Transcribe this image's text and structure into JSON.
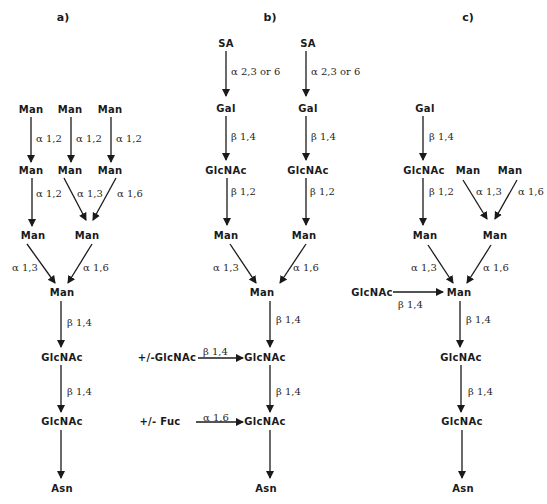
{
  "panels": [
    {
      "label": "a)",
      "label_pos": [
        63,
        21
      ],
      "nodes": [
        {
          "id": "a_m1",
          "text": "Man",
          "x": 31,
          "y": 113
        },
        {
          "id": "a_m2",
          "text": "Man",
          "x": 70,
          "y": 113
        },
        {
          "id": "a_m3",
          "text": "Man",
          "x": 110,
          "y": 113
        },
        {
          "id": "a_m4",
          "text": "Man",
          "x": 31,
          "y": 174
        },
        {
          "id": "a_m5",
          "text": "Man",
          "x": 70,
          "y": 174
        },
        {
          "id": "a_m6",
          "text": "Man",
          "x": 110,
          "y": 174
        },
        {
          "id": "a_m7",
          "text": "Man",
          "x": 33,
          "y": 239
        },
        {
          "id": "a_m8",
          "text": "Man",
          "x": 87,
          "y": 239
        },
        {
          "id": "a_m9",
          "text": "Man",
          "x": 62,
          "y": 296
        },
        {
          "id": "a_g1",
          "text": "GlcNAc",
          "x": 62,
          "y": 361
        },
        {
          "id": "a_g2",
          "text": "GlcNAc",
          "x": 62,
          "y": 425
        },
        {
          "id": "a_asn",
          "text": "Asn",
          "x": 62,
          "y": 492
        }
      ],
      "edges": [
        {
          "x1": 31,
          "y1": 117,
          "x2": 31,
          "y2": 162,
          "label": "α 1,2",
          "lx": 36,
          "ly": 139
        },
        {
          "x1": 71,
          "y1": 117,
          "x2": 71,
          "y2": 162,
          "label": "α 1,2",
          "lx": 76,
          "ly": 139
        },
        {
          "x1": 111,
          "y1": 117,
          "x2": 111,
          "y2": 162,
          "label": "α 1,2",
          "lx": 116,
          "ly": 139
        },
        {
          "x1": 32,
          "y1": 178,
          "x2": 32,
          "y2": 226,
          "label": "α 1,2",
          "lx": 36,
          "ly": 194
        },
        {
          "x1": 64,
          "y1": 178,
          "x2": 86,
          "y2": 220,
          "label": "α 1,3",
          "lx": 77,
          "ly": 194
        },
        {
          "x1": 116,
          "y1": 178,
          "x2": 93,
          "y2": 220,
          "label": "α 1,6",
          "lx": 117,
          "ly": 194
        },
        {
          "x1": 27,
          "y1": 244,
          "x2": 55,
          "y2": 283,
          "label": "α 1,3",
          "lx": 12,
          "ly": 268
        },
        {
          "x1": 92,
          "y1": 244,
          "x2": 68,
          "y2": 283,
          "label": "α 1,6",
          "lx": 83,
          "ly": 268
        },
        {
          "x1": 61,
          "y1": 301,
          "x2": 61,
          "y2": 347,
          "label": "β 1,4",
          "lx": 67,
          "ly": 323
        },
        {
          "x1": 61,
          "y1": 365,
          "x2": 61,
          "y2": 412,
          "label": "β 1,4",
          "lx": 67,
          "ly": 392
        },
        {
          "x1": 61,
          "y1": 430,
          "x2": 61,
          "y2": 478,
          "label": "",
          "lx": 0,
          "ly": 0
        }
      ]
    },
    {
      "label": "b)",
      "label_pos": [
        270,
        21
      ],
      "nodes": [
        {
          "id": "b_sa1",
          "text": "SA",
          "x": 226,
          "y": 47
        },
        {
          "id": "b_sa2",
          "text": "SA",
          "x": 308,
          "y": 47
        },
        {
          "id": "b_gal1",
          "text": "Gal",
          "x": 226,
          "y": 112
        },
        {
          "id": "b_gal2",
          "text": "Gal",
          "x": 308,
          "y": 112
        },
        {
          "id": "b_g1",
          "text": "GlcNAc",
          "x": 226,
          "y": 174
        },
        {
          "id": "b_g2",
          "text": "GlcNAc",
          "x": 308,
          "y": 174
        },
        {
          "id": "b_m1",
          "text": "Man",
          "x": 226,
          "y": 239
        },
        {
          "id": "b_m2",
          "text": "Man",
          "x": 304,
          "y": 239
        },
        {
          "id": "b_m3",
          "text": "Man",
          "x": 262,
          "y": 296
        },
        {
          "id": "b_g3",
          "text": "GlcNAc",
          "x": 265,
          "y": 361
        },
        {
          "id": "b_g4",
          "text": "GlcNAc",
          "x": 265,
          "y": 425
        },
        {
          "id": "b_asn",
          "text": "Asn",
          "x": 266,
          "y": 492
        },
        {
          "id": "b_opt1",
          "text": "+/-GlcNAc",
          "x": 167,
          "y": 361
        },
        {
          "id": "b_opt2",
          "text": "+/-  Fuc",
          "x": 160,
          "y": 425
        }
      ],
      "edges": [
        {
          "x1": 226,
          "y1": 51,
          "x2": 226,
          "y2": 96,
          "label": "α 2,3 or 6",
          "lx": 231,
          "ly": 72
        },
        {
          "x1": 306,
          "y1": 51,
          "x2": 306,
          "y2": 96,
          "label": "α 2,3 or 6",
          "lx": 311,
          "ly": 72
        },
        {
          "x1": 226,
          "y1": 116,
          "x2": 226,
          "y2": 160,
          "label": "β 1,4",
          "lx": 231,
          "ly": 137
        },
        {
          "x1": 306,
          "y1": 116,
          "x2": 306,
          "y2": 160,
          "label": "β 1,4",
          "lx": 311,
          "ly": 137
        },
        {
          "x1": 227,
          "y1": 178,
          "x2": 227,
          "y2": 225,
          "label": "β 1,2",
          "lx": 231,
          "ly": 192
        },
        {
          "x1": 306,
          "y1": 178,
          "x2": 306,
          "y2": 225,
          "label": "β 1,2",
          "lx": 310,
          "ly": 192
        },
        {
          "x1": 230,
          "y1": 244,
          "x2": 256,
          "y2": 283,
          "label": "α 1,3",
          "lx": 213,
          "ly": 268
        },
        {
          "x1": 306,
          "y1": 244,
          "x2": 280,
          "y2": 283,
          "label": "α 1,6",
          "lx": 293,
          "ly": 268
        },
        {
          "x1": 270,
          "y1": 301,
          "x2": 270,
          "y2": 347,
          "label": "β 1,4",
          "lx": 276,
          "ly": 320
        },
        {
          "x1": 198,
          "y1": 358,
          "x2": 243,
          "y2": 358,
          "label": "β 1,4",
          "lx": 203,
          "ly": 352
        },
        {
          "x1": 270,
          "y1": 365,
          "x2": 270,
          "y2": 412,
          "label": "β 1,4",
          "lx": 276,
          "ly": 392
        },
        {
          "x1": 196,
          "y1": 422,
          "x2": 243,
          "y2": 422,
          "label": "α 1,6",
          "lx": 203,
          "ly": 418
        },
        {
          "x1": 270,
          "y1": 430,
          "x2": 270,
          "y2": 478,
          "label": "",
          "lx": 0,
          "ly": 0
        }
      ]
    },
    {
      "label": "c)",
      "label_pos": [
        468,
        21
      ],
      "nodes": [
        {
          "id": "c_gal",
          "text": "Gal",
          "x": 425,
          "y": 112
        },
        {
          "id": "c_g1",
          "text": "GlcNAc",
          "x": 424,
          "y": 174
        },
        {
          "id": "c_m1",
          "text": "Man",
          "x": 468,
          "y": 174
        },
        {
          "id": "c_m2",
          "text": "Man",
          "x": 510,
          "y": 174
        },
        {
          "id": "c_m3",
          "text": "Man",
          "x": 425,
          "y": 239
        },
        {
          "id": "c_m4",
          "text": "Man",
          "x": 495,
          "y": 239
        },
        {
          "id": "c_m5",
          "text": "Man",
          "x": 459,
          "y": 296
        },
        {
          "id": "c_g2",
          "text": "GlcNAc",
          "x": 372,
          "y": 296
        },
        {
          "id": "c_g3",
          "text": "GlcNAc",
          "x": 461,
          "y": 361
        },
        {
          "id": "c_g4",
          "text": "GlcNAc",
          "x": 462,
          "y": 425
        },
        {
          "id": "c_asn",
          "text": "Asn",
          "x": 463,
          "y": 492
        }
      ],
      "edges": [
        {
          "x1": 423,
          "y1": 116,
          "x2": 423,
          "y2": 160,
          "label": "β 1,4",
          "lx": 429,
          "ly": 137
        },
        {
          "x1": 423,
          "y1": 178,
          "x2": 423,
          "y2": 225,
          "label": "β 1,2",
          "lx": 429,
          "ly": 192
        },
        {
          "x1": 463,
          "y1": 180,
          "x2": 487,
          "y2": 219,
          "label": "α 1,3",
          "lx": 476,
          "ly": 192
        },
        {
          "x1": 517,
          "y1": 180,
          "x2": 495,
          "y2": 219,
          "label": "α 1,6",
          "lx": 518,
          "ly": 192
        },
        {
          "x1": 428,
          "y1": 245,
          "x2": 453,
          "y2": 283,
          "label": "α 1,3",
          "lx": 411,
          "ly": 268
        },
        {
          "x1": 491,
          "y1": 245,
          "x2": 467,
          "y2": 283,
          "label": "α 1,6",
          "lx": 483,
          "ly": 268
        },
        {
          "x1": 393,
          "y1": 292,
          "x2": 443,
          "y2": 292,
          "label": "β 1,4",
          "lx": 398,
          "ly": 305
        },
        {
          "x1": 460,
          "y1": 301,
          "x2": 460,
          "y2": 347,
          "label": "β 1,4",
          "lx": 466,
          "ly": 320
        },
        {
          "x1": 461,
          "y1": 365,
          "x2": 461,
          "y2": 412,
          "label": "β 1,4",
          "lx": 468,
          "ly": 392
        },
        {
          "x1": 462,
          "y1": 430,
          "x2": 462,
          "y2": 478,
          "label": "",
          "lx": 0,
          "ly": 0
        }
      ]
    }
  ]
}
